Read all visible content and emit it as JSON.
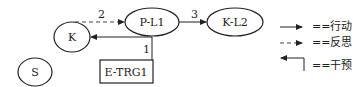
{
  "diagram": {
    "nodes": [
      {
        "id": "K",
        "label": "K",
        "shape": "ellipse"
      },
      {
        "id": "S",
        "label": "S",
        "shape": "ellipse"
      },
      {
        "id": "P-L1",
        "label": "P-L1",
        "shape": "ellipse"
      },
      {
        "id": "K-L2",
        "label": "K-L2",
        "shape": "ellipse"
      },
      {
        "id": "E-TRG1",
        "label": "E-TRG1",
        "shape": "rectangle"
      }
    ],
    "edges": [
      {
        "from": "E-TRG1",
        "to": "K",
        "label": "1",
        "type": "intervention"
      },
      {
        "from": "K",
        "to": "P-L1",
        "label": "2",
        "type": "reflection"
      },
      {
        "from": "P-L1",
        "to": "K-L2",
        "label": "3",
        "type": "action"
      }
    ],
    "legend": [
      {
        "style": "solid-arrow",
        "label": "==行动"
      },
      {
        "style": "dashed-arrow",
        "label": "==反思"
      },
      {
        "style": "elbow-arrow",
        "label": "==干预"
      }
    ]
  }
}
